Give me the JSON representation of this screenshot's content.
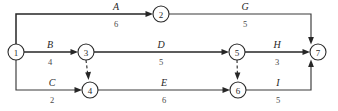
{
  "diagram": {
    "type": "activity-on-arrow network diagram",
    "nodes": [
      {
        "id": "1",
        "label": "1",
        "cx": 16,
        "cy": 52,
        "r": 8
      },
      {
        "id": "2",
        "label": "2",
        "cx": 161,
        "cy": 14,
        "r": 8
      },
      {
        "id": "3",
        "label": "3",
        "cx": 86,
        "cy": 52,
        "r": 8
      },
      {
        "id": "4",
        "label": "4",
        "cx": 90,
        "cy": 90,
        "r": 8
      },
      {
        "id": "5",
        "label": "5",
        "cx": 237,
        "cy": 52,
        "r": 8
      },
      {
        "id": "6",
        "label": "6",
        "cx": 238,
        "cy": 90,
        "r": 8
      },
      {
        "id": "7",
        "label": "7",
        "cx": 318,
        "cy": 52,
        "r": 8
      }
    ],
    "edges": [
      {
        "id": "A",
        "name": "A",
        "duration": "6",
        "from": "1",
        "to": "2",
        "style": "solid",
        "name_x": 116,
        "name_y": 10,
        "dur_x": 116,
        "dur_y": 27
      },
      {
        "id": "G",
        "name": "G",
        "duration": "5",
        "from": "2",
        "to": "7",
        "style": "solid",
        "name_x": 245,
        "name_y": 10,
        "dur_x": 245,
        "dur_y": 27
      },
      {
        "id": "B",
        "name": "B",
        "duration": "4",
        "from": "1",
        "to": "3",
        "style": "solid",
        "name_x": 50,
        "name_y": 48,
        "dur_x": 50,
        "dur_y": 65
      },
      {
        "id": "D",
        "name": "D",
        "duration": "5",
        "from": "3",
        "to": "5",
        "style": "solid",
        "name_x": 161,
        "name_y": 48,
        "dur_x": 161,
        "dur_y": 65
      },
      {
        "id": "H",
        "name": "H",
        "duration": "3",
        "from": "5",
        "to": "7",
        "style": "solid",
        "name_x": 277,
        "name_y": 48,
        "dur_x": 277,
        "dur_y": 65
      },
      {
        "id": "C",
        "name": "C",
        "duration": "2",
        "from": "1",
        "to": "4",
        "style": "solid",
        "name_x": 52,
        "name_y": 86,
        "dur_x": 52,
        "dur_y": 103
      },
      {
        "id": "E",
        "name": "E",
        "duration": "6",
        "from": "4",
        "to": "6",
        "style": "solid",
        "name_x": 164,
        "name_y": 86,
        "dur_x": 164,
        "dur_y": 103
      },
      {
        "id": "I",
        "name": "I",
        "duration": "5",
        "from": "6",
        "to": "7",
        "style": "solid",
        "name_x": 278,
        "name_y": 86,
        "dur_x": 278,
        "dur_y": 103
      },
      {
        "id": "dummy-3-4",
        "name": "",
        "duration": "",
        "from": "3",
        "to": "4",
        "style": "dashed"
      },
      {
        "id": "dummy-5-6",
        "name": "",
        "duration": "",
        "from": "5",
        "to": "6",
        "style": "dashed"
      }
    ],
    "colors": {
      "stroke": "#2b2b2b",
      "label": "#1f1f1f",
      "duration": "#4a4a4a",
      "background": "#ffffff"
    }
  }
}
